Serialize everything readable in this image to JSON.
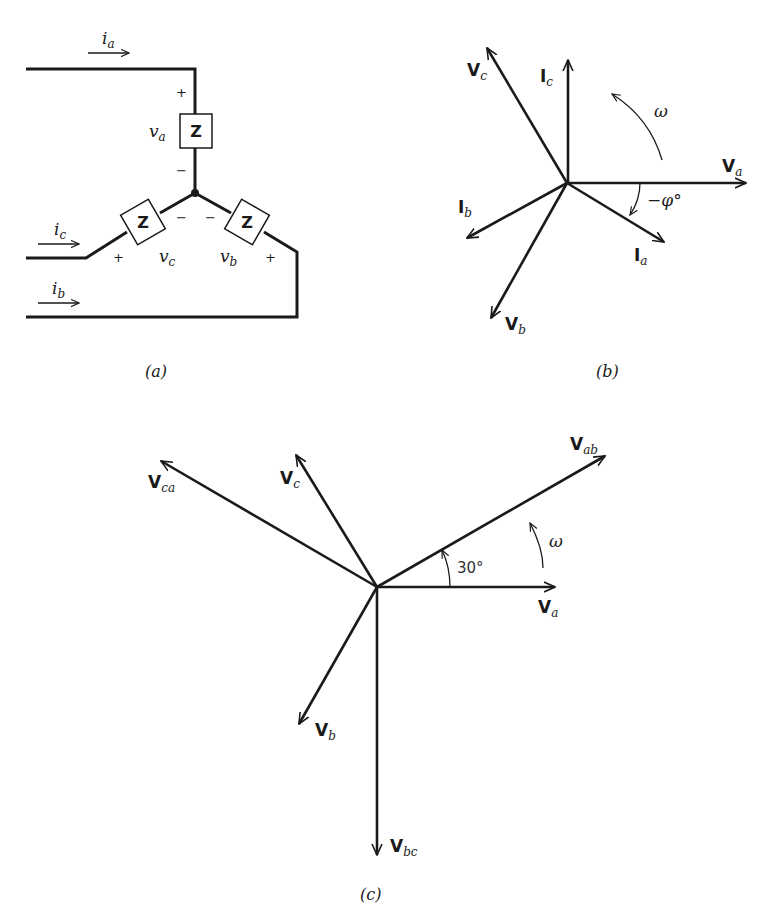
{
  "colors": {
    "ink": "#1a1a1a",
    "background": "#ffffff"
  },
  "panel_a": {
    "caption": "(a)",
    "impedance_label": "Z",
    "currents": [
      {
        "symbol": "i",
        "sub": "a"
      },
      {
        "symbol": "i",
        "sub": "c"
      },
      {
        "symbol": "i",
        "sub": "b"
      }
    ],
    "voltages": [
      {
        "symbol": "v",
        "sub": "a",
        "plus": "+",
        "minus": "−"
      },
      {
        "symbol": "v",
        "sub": "c",
        "plus": "+",
        "minus": "−"
      },
      {
        "symbol": "v",
        "sub": "b",
        "plus": "+",
        "minus": "−"
      }
    ]
  },
  "panel_b": {
    "caption": "(b)",
    "rotation_label": "ω",
    "angle_label": "−φ°",
    "phasors": [
      {
        "symbol": "V",
        "sub": "a"
      },
      {
        "symbol": "V",
        "sub": "b"
      },
      {
        "symbol": "V",
        "sub": "c"
      },
      {
        "symbol": "I",
        "sub": "a"
      },
      {
        "symbol": "I",
        "sub": "b"
      },
      {
        "symbol": "I",
        "sub": "c"
      }
    ]
  },
  "panel_c": {
    "caption": "(c)",
    "rotation_label": "ω",
    "angle_label": "30°",
    "phasors": [
      {
        "symbol": "V",
        "sub": "ab"
      },
      {
        "symbol": "V",
        "sub": "a"
      },
      {
        "symbol": "V",
        "sub": "c"
      },
      {
        "symbol": "V",
        "sub": "ca"
      },
      {
        "symbol": "V",
        "sub": "b"
      },
      {
        "symbol": "V",
        "sub": "bc"
      }
    ]
  }
}
